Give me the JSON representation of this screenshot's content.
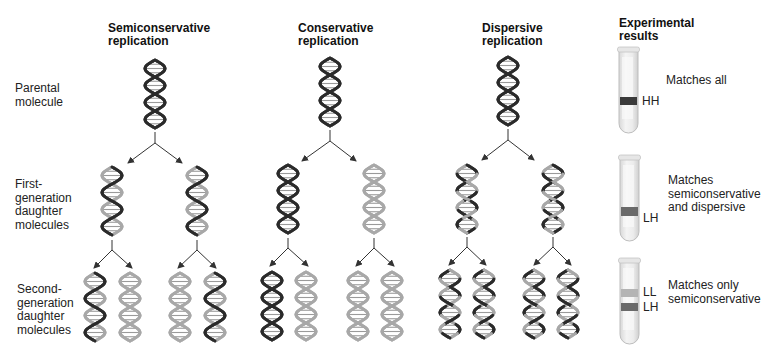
{
  "columns": [
    {
      "id": "semiconservative",
      "title_line1": "Semiconservative",
      "title_line2": "replication"
    },
    {
      "id": "conservative",
      "title_line1": "Conservative",
      "title_line2": "replication"
    },
    {
      "id": "dispersive",
      "title_line1": "Dispersive",
      "title_line2": "replication"
    },
    {
      "id": "experimental",
      "title_line1": "Experimental",
      "title_line2": "results"
    }
  ],
  "rows": [
    {
      "id": "parental",
      "lines": [
        "Parental",
        "molecule"
      ]
    },
    {
      "id": "first",
      "lines": [
        "First-",
        "generation",
        "daughter",
        "molecules"
      ]
    },
    {
      "id": "second",
      "lines": [
        "Second-",
        "generation",
        "daughter",
        "molecules"
      ]
    }
  ],
  "results": [
    {
      "tube": "tube-1",
      "bands": [
        {
          "label": "HH",
          "shade": "#3a3a3a"
        }
      ],
      "note_lines": [
        "Matches all"
      ]
    },
    {
      "tube": "tube-2",
      "bands": [
        {
          "label": "LH",
          "shade": "#6a6a6a"
        }
      ],
      "note_lines": [
        "Matches",
        "semiconservative",
        "and dispersive"
      ]
    },
    {
      "tube": "tube-3",
      "bands": [
        {
          "label": "LL",
          "shade": "#b4b4b4"
        },
        {
          "label": "LH",
          "shade": "#6a6a6a"
        }
      ],
      "note_lines": [
        "Matches only",
        "semiconservative"
      ]
    }
  ],
  "colors": {
    "heavy_strand": "#2b2b2b",
    "light_strand": "#a8a8a8",
    "arrow": "#333333"
  }
}
